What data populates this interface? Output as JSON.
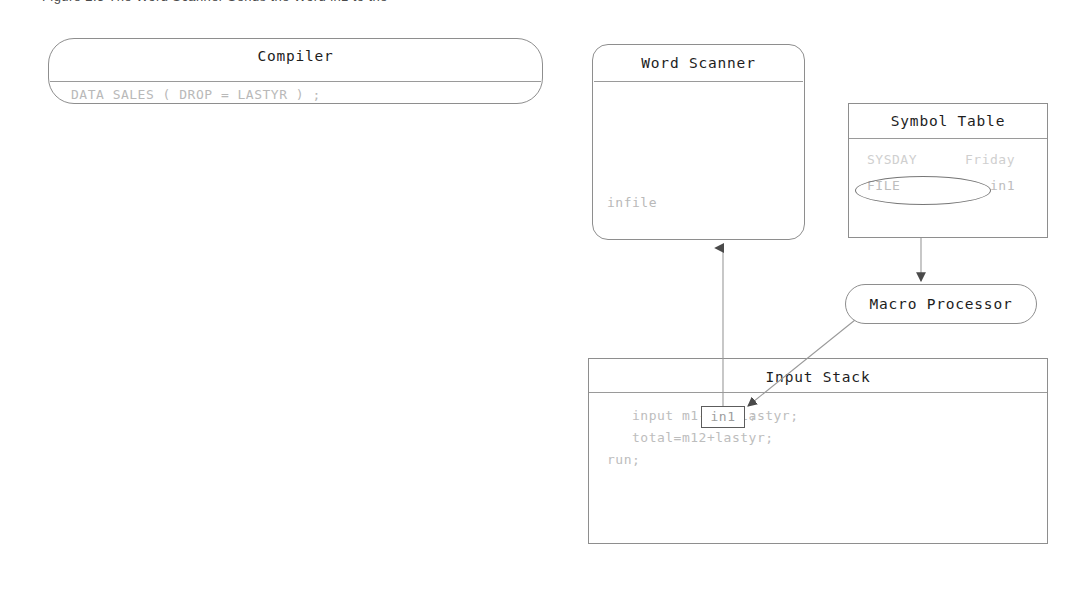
{
  "figure": {
    "caption": "Figure 2.5    The Word Scanner Sends the Word in1 to the"
  },
  "nodes": {
    "compiler": {
      "title": "Compiler",
      "code": "DATA SALES ( DROP = LASTYR ) ;"
    },
    "word_scanner": {
      "title": "Word Scanner",
      "code": "infile"
    },
    "symbol_table": {
      "title": "Symbol Table",
      "rows": [
        {
          "key": "SYSDAY",
          "value": "Friday"
        },
        {
          "key": "FILE",
          "value": "in1"
        }
      ],
      "highlighted_row_index": 1
    },
    "macro_processor": {
      "title": "Macro Processor"
    },
    "input_stack": {
      "title": "Input Stack",
      "highlighted_token": "in1",
      "token_suffix": ";",
      "code_lines": [
        "   input m1-m12 lastyr;",
        "   total=m12+lastyr;",
        "run;"
      ]
    }
  },
  "arrows": [
    {
      "name": "input-stack-to-word-scanner",
      "from": "input-stack-token",
      "to": "word-scanner-bottom",
      "direction": "up"
    },
    {
      "name": "symbol-table-to-macro-processor",
      "from": "symbol-table-bottom",
      "to": "macro-processor-top",
      "direction": "down"
    },
    {
      "name": "macro-processor-to-input-stack-token",
      "from": "macro-processor-bottom-left",
      "to": "input-stack-token",
      "direction": "diagonal-down-left"
    }
  ],
  "colors": {
    "stroke": "#8e8e8e",
    "faded_text": "#bdbdbd",
    "title_text": "#1d1d1d",
    "arrow": "#8a8a8a",
    "background": "#ffffff"
  }
}
